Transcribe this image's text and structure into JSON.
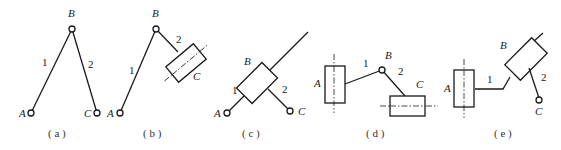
{
  "figure": {
    "panels": [
      {
        "caption": "( a )",
        "labels": {
          "A": "A",
          "B": "B",
          "C": "C",
          "link1": "1",
          "link2": "2"
        },
        "type": "RRR (three revolute joints)"
      },
      {
        "caption": "( b )",
        "labels": {
          "A": "A",
          "B": "B",
          "C": "C",
          "link1": "1",
          "link2": "2"
        },
        "type": "RRP (prismatic at C)"
      },
      {
        "caption": "( c )",
        "labels": {
          "A": "A",
          "B": "B",
          "C": "C",
          "link1": "1",
          "link2": "2"
        },
        "type": "RPR (prismatic at B)"
      },
      {
        "caption": "( d )",
        "labels": {
          "A": "A",
          "B": "B",
          "C": "C",
          "link1": "1",
          "link2": "2"
        },
        "type": "PRP (prismatic at A and C)"
      },
      {
        "caption": "( e )",
        "labels": {
          "A": "A",
          "B": "B",
          "C": "C",
          "link1": "1",
          "link2": "2"
        },
        "type": "PPR (prismatic at A and B)"
      }
    ]
  }
}
